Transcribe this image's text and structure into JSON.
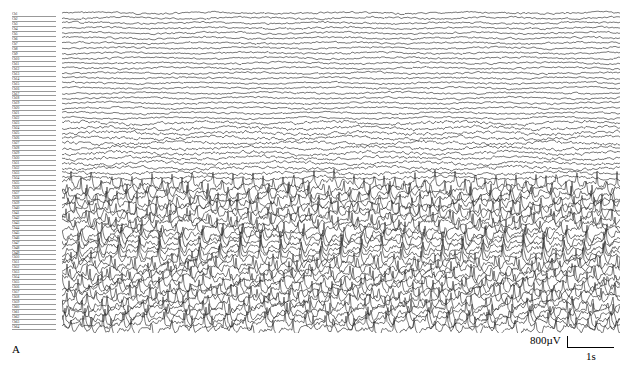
{
  "figure": {
    "panel_letter": "A",
    "type": "multichannel intracranial EEG trace",
    "channel_count": 64,
    "channel_label_prefix": "Ch",
    "channel_labels_legible": false
  },
  "scale_bar": {
    "amplitude_label": "800µV",
    "time_label": "1s"
  },
  "traces": {
    "color": "#222222",
    "background": "#ffffff",
    "duration_seconds": 12,
    "segments": [
      {
        "from_channel": 0,
        "to_channel": 22,
        "style": "low-amplitude mixed fast activity",
        "amplitude": 3
      },
      {
        "from_channel": 22,
        "to_channel": 34,
        "style": "irregular slow waves",
        "amplitude": 5
      },
      {
        "from_channel": 34,
        "to_channel": 64,
        "style": "rhythmic spike-and-wave discharges",
        "amplitude": 8,
        "rate_hz": 2.3
      }
    ]
  }
}
